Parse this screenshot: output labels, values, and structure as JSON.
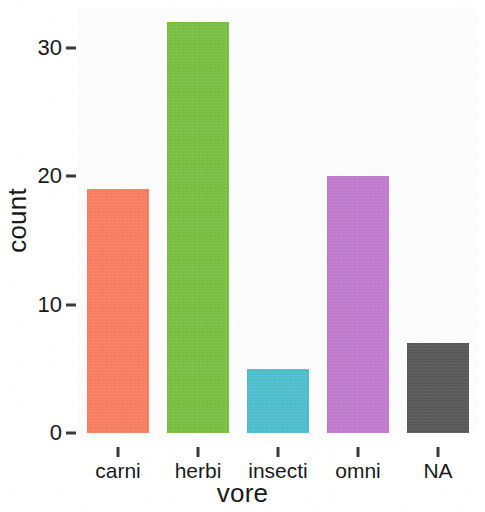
{
  "chart_data": {
    "type": "bar",
    "title": "",
    "subtitle": "",
    "xlabel": "vore",
    "ylabel": "count",
    "categories": [
      "carni",
      "herbi",
      "insecti",
      "omni",
      "NA"
    ],
    "values": [
      19,
      32,
      5,
      20,
      7
    ],
    "series": [
      {
        "name": "count",
        "values": [
          19,
          32,
          5,
          20,
          7
        ]
      }
    ],
    "ylim": [
      0,
      32
    ],
    "y_ticks": [
      0,
      10,
      20,
      30
    ],
    "y_tick_labels": [
      "0",
      "10",
      "20",
      "30"
    ],
    "x_ticks": [
      "carni",
      "herbi",
      "insecti",
      "omni",
      "NA"
    ],
    "grid": false,
    "legend": "none",
    "bar_colors": [
      "#F87F62",
      "#7AC043",
      "#4FBFCE",
      "#C17CCF",
      "#595959"
    ],
    "panel_background": "#FCFCFC",
    "axis_text_color": "#1A1A1A",
    "bars": [
      {
        "category": "carni",
        "value": 19,
        "color": "#F87F62"
      },
      {
        "category": "herbi",
        "value": 32,
        "color": "#7AC043"
      },
      {
        "category": "insecti",
        "value": 5,
        "color": "#4FBFCE"
      },
      {
        "category": "omni",
        "value": 20,
        "color": "#C17CCF"
      },
      {
        "category": "NA",
        "value": 7,
        "color": "#595959"
      }
    ]
  }
}
